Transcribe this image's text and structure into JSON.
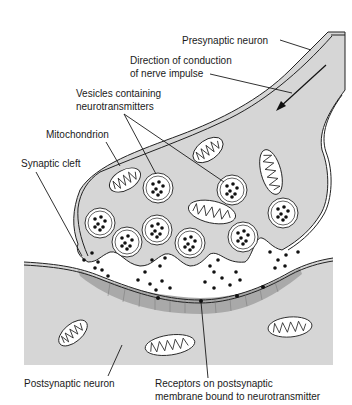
{
  "diagram": {
    "colors": {
      "cytoplasm": "#d6d6d6",
      "postsynaptic_density": "#a9a9a9",
      "membrane": "#222222",
      "background": "#ffffff"
    },
    "labels": {
      "presynaptic_neuron": "Presynaptic neuron",
      "direction_line1": "Direction of conduction",
      "direction_line2": "of nerve impulse",
      "vesicles_line1": "Vesicles containing",
      "vesicles_line2": "neurotransmitters",
      "mitochondrion": "Mitochondrion",
      "synaptic_cleft": "Synaptic cleft",
      "postsynaptic_neuron": "Postsynaptic neuron",
      "receptors_line1": "Receptors on postsynaptic",
      "receptors_line2": "membrane bound to neurotransmitter"
    },
    "components": [
      "presynaptic-axon",
      "axon-terminal",
      "synaptic-vesicles",
      "mitochondria",
      "synaptic-cleft",
      "neurotransmitter-molecules",
      "postsynaptic-membrane",
      "receptors",
      "postsynaptic-neuron"
    ],
    "arrow": {
      "meaning": "direction of nerve impulse",
      "direction": "down-left"
    }
  }
}
